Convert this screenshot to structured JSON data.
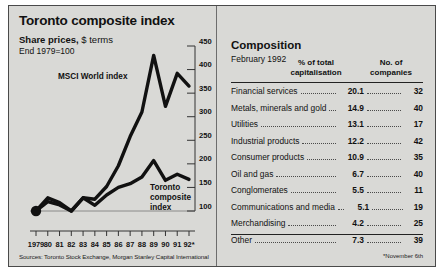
{
  "chart_panel": {
    "title": "Toronto composite index",
    "subtitle_bold": "Share prices,",
    "subtitle_rest": " $ terms",
    "subtitle_2": "End 1979=100",
    "sources": "Sources: Toronto Stock Exchange, Morgan Stanley Capital International",
    "series_labels": {
      "msci": "MSCI World index",
      "tsx_line1": "Toronto",
      "tsx_line2": "composite",
      "tsx_line3": "index"
    }
  },
  "composition_panel": {
    "title": "Composition",
    "subtitle": "February 1992",
    "col_head_1_line1": "% of total",
    "col_head_1_line2": "capitalisation",
    "col_head_2_line1": "No. of",
    "col_head_2_line2": "companies",
    "footnote": "*November 6th",
    "rows": [
      {
        "name": "Financial services",
        "pct": "20.1",
        "count": "32"
      },
      {
        "name": "Metals, minerals and gold",
        "pct": "14.9",
        "count": "40"
      },
      {
        "name": "Utilities",
        "pct": "13.1",
        "count": "17"
      },
      {
        "name": "Industrial products",
        "pct": "12.2",
        "count": "42"
      },
      {
        "name": "Consumer products",
        "pct": "10.9",
        "count": "35"
      },
      {
        "name": "Oil and gas",
        "pct": "6.7",
        "count": "40"
      },
      {
        "name": "Conglomerates",
        "pct": "5.5",
        "count": "11"
      },
      {
        "name": "Communications and media",
        "pct": "5.1",
        "count": "19"
      },
      {
        "name": "Merchandising",
        "pct": "4.2",
        "count": "25"
      },
      {
        "name": "Other",
        "pct": "7.3",
        "count": "39"
      }
    ]
  },
  "chart_data": {
    "type": "line",
    "title": "Toronto composite index",
    "subtitle": "Share prices, $ terms; End 1979=100",
    "xlabel": "",
    "ylabel": "",
    "ylim": [
      100,
      450
    ],
    "yticks": [
      100,
      150,
      200,
      250,
      300,
      350,
      400,
      450
    ],
    "grid": false,
    "axis_side": "right",
    "x": [
      "1979",
      "80",
      "81",
      "82",
      "83",
      "84",
      "85",
      "86",
      "87",
      "88",
      "89",
      "90",
      "91",
      "92*"
    ],
    "xtick_labels": [
      "1979",
      "80",
      "81",
      "82",
      "83",
      "84",
      "85",
      "86",
      "87",
      "88",
      "89",
      "90",
      "91",
      "92*"
    ],
    "legend_position": "inline-annotations",
    "series": [
      {
        "name": "MSCI World index",
        "values": [
          100,
          128,
          118,
          100,
          128,
          125,
          152,
          196,
          258,
          310,
          430,
          322,
          392,
          365
        ]
      },
      {
        "name": "Toronto composite index",
        "values": [
          100,
          120,
          113,
          100,
          128,
          112,
          134,
          150,
          158,
          172,
          207,
          165,
          178,
          167
        ]
      }
    ],
    "annotations": [
      {
        "text": "MSCI World index",
        "series": "MSCI World index"
      },
      {
        "text": "Toronto composite index",
        "series": "Toronto composite index"
      }
    ],
    "marker_point": {
      "x": "1979",
      "y": 100,
      "style": "filled-circle"
    }
  }
}
